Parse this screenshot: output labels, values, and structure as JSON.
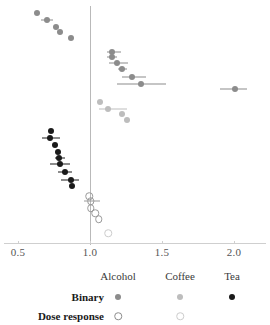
{
  "chart_data": {
    "type": "scatter",
    "title": "",
    "xlabel": "",
    "ylabel": "",
    "xlim": [
      0.42,
      2.12
    ],
    "xticks": [
      0.5,
      1.0,
      1.5,
      2.0
    ],
    "xtick_labels": [
      "0.5",
      "1.0",
      "1.5",
      "2.0"
    ],
    "grid": false,
    "reference_line": 1.0,
    "orientation": "horizontal-forest-plot",
    "note": "Forest plot of effect estimates with horizontal confidence-interval whiskers; vertical reference line at 1.0",
    "legend": {
      "position": "bottom",
      "columns": [
        "Alcohol",
        "Coffee",
        "Tea"
      ],
      "rows": [
        "Binary",
        "Dose response"
      ],
      "entries": [
        {
          "row": "Binary",
          "column": "Alcohol",
          "marker": "filled-circle",
          "color": "#8c8c8c"
        },
        {
          "row": "Binary",
          "column": "Coffee",
          "marker": "filled-circle",
          "color": "#bdbdbd"
        },
        {
          "row": "Binary",
          "column": "Tea",
          "marker": "filled-circle",
          "color": "#1a1a1a"
        },
        {
          "row": "Dose response",
          "column": "Alcohol",
          "marker": "open-circle",
          "color": "#8c8c8c"
        },
        {
          "row": "Dose response",
          "column": "Coffee",
          "marker": "open-circle",
          "color": "#cccccc"
        },
        {
          "row": "Dose response",
          "column": "Tea",
          "marker": "none",
          "color": ""
        }
      ]
    },
    "series": [
      {
        "name": "Alcohol",
        "marker": "filled-circle",
        "color": "#8c8c8c",
        "points": [
          {
            "x": 0.63,
            "y": 13,
            "lo": 0.63,
            "hi": 0.63
          },
          {
            "x": 0.7,
            "y": 20,
            "lo": 0.66,
            "hi": 0.745
          },
          {
            "x": 0.765,
            "y": 27,
            "lo": 0.765,
            "hi": 0.765
          },
          {
            "x": 0.795,
            "y": 32,
            "lo": 0.795,
            "hi": 0.795
          },
          {
            "x": 0.865,
            "y": 38,
            "lo": 0.865,
            "hi": 0.865
          },
          {
            "x": 1.155,
            "y": 52,
            "lo": 1.115,
            "hi": 1.215
          },
          {
            "x": 1.155,
            "y": 57,
            "lo": 1.115,
            "hi": 1.19
          },
          {
            "x": 1.19,
            "y": 63,
            "lo": 1.135,
            "hi": 1.265
          },
          {
            "x": 1.225,
            "y": 69,
            "lo": 1.195,
            "hi": 1.26
          },
          {
            "x": 1.29,
            "y": 77,
            "lo": 1.225,
            "hi": 1.39
          },
          {
            "x": 1.355,
            "y": 84,
            "lo": 1.19,
            "hi": 1.53
          },
          {
            "x": 2.005,
            "y": 89,
            "lo": 1.9,
            "hi": 2.09
          }
        ]
      },
      {
        "name": "Coffee",
        "marker": "filled-circle",
        "color": "#bdbdbd",
        "points": [
          {
            "x": 1.07,
            "y": 102,
            "lo": 1.07,
            "hi": 1.07
          },
          {
            "x": 1.125,
            "y": 109,
            "lo": 1.06,
            "hi": 1.255
          },
          {
            "x": 1.225,
            "y": 114,
            "lo": 1.225,
            "hi": 1.225
          },
          {
            "x": 1.26,
            "y": 120,
            "lo": 1.26,
            "hi": 1.26
          }
        ]
      },
      {
        "name": "Tea",
        "marker": "filled-circle",
        "color": "#1a1a1a",
        "points": [
          {
            "x": 0.73,
            "y": 131,
            "lo": 0.73,
            "hi": 0.73
          },
          {
            "x": 0.725,
            "y": 138,
            "lo": 0.67,
            "hi": 0.79
          },
          {
            "x": 0.755,
            "y": 145,
            "lo": 0.755,
            "hi": 0.755
          },
          {
            "x": 0.775,
            "y": 152,
            "lo": 0.775,
            "hi": 0.775
          },
          {
            "x": 0.785,
            "y": 158,
            "lo": 0.755,
            "hi": 0.825
          },
          {
            "x": 0.795,
            "y": 164,
            "lo": 0.72,
            "hi": 0.86
          },
          {
            "x": 0.825,
            "y": 172,
            "lo": 0.78,
            "hi": 0.875
          },
          {
            "x": 0.865,
            "y": 180,
            "lo": 0.8,
            "hi": 0.925
          },
          {
            "x": 0.875,
            "y": 186,
            "lo": 0.875,
            "hi": 0.875
          }
        ]
      },
      {
        "name": "Alcohol dose response",
        "marker": "open-circle",
        "color": "#9a9a9a",
        "points": [
          {
            "x": 0.995,
            "y": 196,
            "lo": 0.995,
            "hi": 0.995
          },
          {
            "x": 1.005,
            "y": 201,
            "lo": 0.96,
            "hi": 1.07
          },
          {
            "x": 1.005,
            "y": 208,
            "lo": 1.005,
            "hi": 1.005
          },
          {
            "x": 1.035,
            "y": 213,
            "lo": 1.035,
            "hi": 1.035
          },
          {
            "x": 1.06,
            "y": 219,
            "lo": 1.06,
            "hi": 1.06
          }
        ]
      },
      {
        "name": "Coffee dose response",
        "marker": "open-circle",
        "color": "#cccccc",
        "points": [
          {
            "x": 1.125,
            "y": 233,
            "lo": 1.125,
            "hi": 1.125
          }
        ]
      }
    ]
  }
}
